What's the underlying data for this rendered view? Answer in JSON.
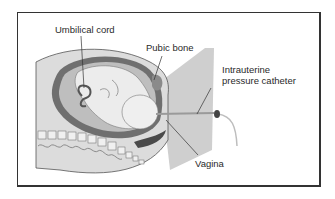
{
  "figure": {
    "type": "anatomical-illustration",
    "colors": {
      "border": "#333333",
      "skin": "#d9d9d9",
      "uterus_wall": "#6e6e6e",
      "amniotic": "#bdbdbd",
      "fetus": "#e8e8e8",
      "spine": "#efefef",
      "shadow_plane": "#c8c8c8",
      "leader_line": "#333333",
      "catheter": "#d6d6d6"
    }
  },
  "labels": {
    "umbilical_cord": "Umbilical cord",
    "pubic_bone": "Pubic bone",
    "catheter_line1": "Intrauterine",
    "catheter_line2": "pressure catheter",
    "vagina": "Vagina"
  }
}
